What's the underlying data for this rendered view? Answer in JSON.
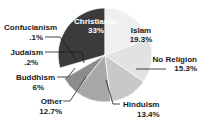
{
  "chart_data": {
    "type": "pie",
    "title": "",
    "subtitle": "",
    "xlabel": "",
    "ylabel": "",
    "legend_position": "none",
    "grid": false,
    "units": "percent",
    "categories": [
      "Christianity",
      "Islam",
      "No Religion",
      "Hinduism",
      "Other",
      "Buddhism",
      "Judaism",
      "Confucianism"
    ],
    "values": [
      33,
      19.3,
      15.3,
      13.4,
      12.7,
      6,
      0.2,
      0.1
    ],
    "slices": [
      {
        "name": "Christianity",
        "label": "Christianity",
        "value": 33,
        "value_label": "33%",
        "color": "#3b3b3b",
        "label_placement": "inside",
        "text_color": "#ffffff"
      },
      {
        "name": "Islam",
        "label": "Islam",
        "value": 19.3,
        "value_label": "19.3%",
        "color": "#efefef",
        "label_placement": "inside",
        "text_color": "#1a1a1a"
      },
      {
        "name": "No Religion",
        "label": "No Religion",
        "value": 15.3,
        "value_label": "15.3%",
        "color": "#e2e2e2",
        "label_placement": "outside-right",
        "text_color": "#1a1a1a"
      },
      {
        "name": "Hinduism",
        "label": "Hinduism",
        "value": 13.4,
        "value_label": "13.4%",
        "color": "#c8c8c8",
        "label_placement": "outside-bottom-right",
        "text_color": "#1a1a1a"
      },
      {
        "name": "Other",
        "label": "Other",
        "value": 12.7,
        "value_label": "12.7%",
        "color": "#a8a8a8",
        "label_placement": "outside-bottom-left",
        "text_color": "#1a1a1a"
      },
      {
        "name": "Buddhism",
        "label": "Buddhism",
        "value": 6,
        "value_label": "6%",
        "color": "#8c8c8c",
        "label_placement": "outside-left",
        "text_color": "#1a1a1a"
      },
      {
        "name": "Judaism",
        "label": "Judaism",
        "value": 0.2,
        "value_label": ".2%",
        "color": "#6f6f6f",
        "label_placement": "outside-left",
        "text_color": "#1a1a1a"
      },
      {
        "name": "Confucianism",
        "label": "Confucianism",
        "value": 0.1,
        "value_label": ".1%",
        "color": "#111111",
        "label_placement": "outside-left",
        "text_color": "#1a1a1a"
      }
    ]
  },
  "labels": {
    "christianity_name": "Christianity",
    "christianity_value": "33%",
    "islam_name": "Islam",
    "islam_value": "19.3%",
    "noreligion_name": "No Religion",
    "noreligion_value": "15.3%",
    "hinduism_name": "Hinduism",
    "hinduism_value": "13.4%",
    "other_name": "Other",
    "other_value": "12.7%",
    "buddhism_name": "Buddhism",
    "buddhism_value": "6%",
    "judaism_name": "Judaism",
    "judaism_value": ".2%",
    "confucianism_name": "Confucianism",
    "confucianism_value": ".1%"
  }
}
